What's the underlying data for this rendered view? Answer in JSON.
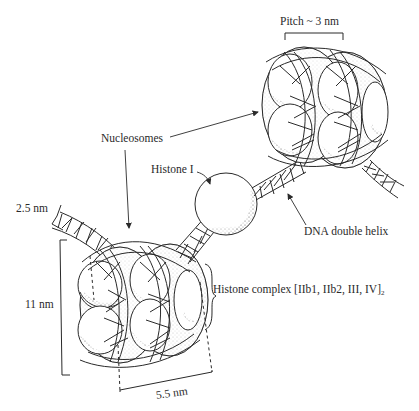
{
  "figure": {
    "labels": {
      "pitch": "Pitch ~ 3 nm",
      "nucleosomes": "Nucleosomes",
      "histone_i": "Histone I",
      "dna_width": "2.5 nm",
      "dna_double_helix": "DNA double helix",
      "core_height": "11 nm",
      "histone_complex": "Histone complex [IIb1, IIb2, III, IV]",
      "histone_complex_subscript": "2",
      "core_width": "5.5 nm"
    },
    "components": [
      "upper nucleosome pair (helical, pitch ~3 nm)",
      "histone I sphere on linker DNA",
      "lower nucleosome pair (11 nm x 5.5 nm)",
      "DNA double helix wrapping histone cores"
    ],
    "colors": {
      "ink": "#2a2a2a",
      "background": "#ffffff",
      "stipple": "#555555"
    }
  }
}
